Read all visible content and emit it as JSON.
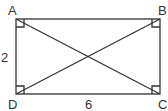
{
  "diagram": {
    "type": "geometry",
    "shape": "rectangle",
    "vertices": [
      {
        "label": "A",
        "position": "top-left"
      },
      {
        "label": "B",
        "position": "top-right"
      },
      {
        "label": "C",
        "position": "bottom-right"
      },
      {
        "label": "D",
        "position": "bottom-left"
      }
    ],
    "side_labels": {
      "AD": "2",
      "DC": "6"
    },
    "diagonals": [
      "AC",
      "BD"
    ],
    "right_angle_markers": [
      "A",
      "B",
      "C",
      "D"
    ],
    "colors": {
      "stroke": "#333333",
      "background": "#ffffff"
    }
  }
}
